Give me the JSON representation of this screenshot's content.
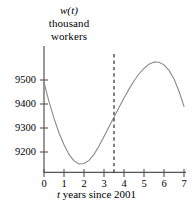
{
  "chart_data": {
    "type": "line",
    "title": "",
    "subtitle": "",
    "ylabel_line1": "w(t)",
    "ylabel_line2": "thousand",
    "ylabel_line3": "workers",
    "xlabel_prefix": "t",
    "xlabel_rest": " years since 2001",
    "xlabel_full": "t years since 2001",
    "grid": false,
    "legend": false,
    "legend_position": "none",
    "xlim": [
      0,
      7
    ],
    "ylim": [
      9115,
      9610
    ],
    "y_ticks": [
      9200,
      9300,
      9400,
      9500
    ],
    "y_tick_labels": [
      "9200",
      "9300",
      "9400",
      "9500"
    ],
    "x_ticks": [
      0,
      1,
      2,
      3,
      4,
      5,
      6,
      7
    ],
    "x_tick_labels": [
      "0",
      "1",
      "2",
      "3",
      "4",
      "5",
      "6",
      "7"
    ],
    "series": [
      {
        "name": "w(t)",
        "color": "#8a8a8a",
        "x": [
          0,
          0.25,
          0.5,
          0.75,
          1,
          1.25,
          1.5,
          1.75,
          2,
          2.25,
          2.5,
          2.75,
          3,
          3.25,
          3.5,
          3.75,
          4,
          4.25,
          4.5,
          4.75,
          5,
          5.25,
          5.5,
          5.75,
          6,
          6.25,
          6.5,
          6.75,
          7
        ],
        "y": [
          9490,
          9410,
          9340,
          9280,
          9230,
          9190,
          9163,
          9150,
          9152,
          9165,
          9190,
          9225,
          9265,
          9305,
          9345,
          9385,
          9425,
          9462,
          9496,
          9525,
          9548,
          9566,
          9575,
          9574,
          9563,
          9540,
          9504,
          9453,
          9390
        ]
      }
    ],
    "annotations": [
      {
        "name": "vertical-dashed-marker",
        "type": "vline",
        "x": 3.5,
        "y_top": 9608,
        "y_bottom": 9115,
        "style": "dashed",
        "color": "#1a1a1a"
      }
    ],
    "axis_color": "#555555",
    "curve_color": "#8a8a8a"
  }
}
